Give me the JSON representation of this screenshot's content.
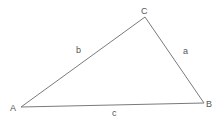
{
  "diagram": {
    "type": "triangle",
    "vertices": [
      {
        "label": "A",
        "x": 21,
        "y": 107
      },
      {
        "label": "B",
        "x": 204,
        "y": 103
      },
      {
        "label": "C",
        "x": 145,
        "y": 17
      }
    ],
    "sides": [
      {
        "label": "a",
        "from": "B",
        "to": "C"
      },
      {
        "label": "b",
        "from": "A",
        "to": "C"
      },
      {
        "label": "c",
        "from": "A",
        "to": "B"
      }
    ],
    "line_color": "#777777",
    "label_color": "#555555"
  }
}
